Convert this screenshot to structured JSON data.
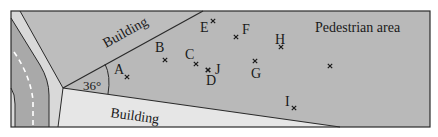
{
  "diagram": {
    "regions": {
      "pedestrian_area": "Pedestrian area",
      "building_top": "Building",
      "building_bottom": "Building"
    },
    "angle": "36°",
    "points": [
      {
        "label": "A",
        "x": 127,
        "y": 77,
        "lx": 114,
        "ly": 74
      },
      {
        "label": "B",
        "x": 165,
        "y": 60,
        "lx": 155,
        "ly": 52
      },
      {
        "label": "C",
        "x": 196,
        "y": 64,
        "lx": 185,
        "ly": 59
      },
      {
        "label": "D",
        "x": 208,
        "y": 70,
        "lx": 206,
        "ly": 85
      },
      {
        "label": "J",
        "x": 208,
        "y": 70,
        "lx": 215,
        "ly": 74
      },
      {
        "label": "E",
        "x": 213,
        "y": 21,
        "lx": 200,
        "ly": 32
      },
      {
        "label": "F",
        "x": 236,
        "y": 37,
        "lx": 242,
        "ly": 34
      },
      {
        "label": "G",
        "x": 255,
        "y": 61,
        "lx": 251,
        "ly": 78
      },
      {
        "label": "H",
        "x": 281,
        "y": 47,
        "lx": 275,
        "ly": 44
      },
      {
        "label": "I",
        "x": 294,
        "y": 108,
        "lx": 285,
        "ly": 106
      },
      {
        "label": "",
        "x": 330,
        "y": 66,
        "lx": 0,
        "ly": 0
      }
    ]
  },
  "colors": {
    "pedestrian": "#b9b9b9",
    "road": "#a9a9a9",
    "sidewalk": "#d9d9d9",
    "building_bottom": "#e6e6e6",
    "line": "#2a2a2a",
    "dash": "#ffffff"
  }
}
